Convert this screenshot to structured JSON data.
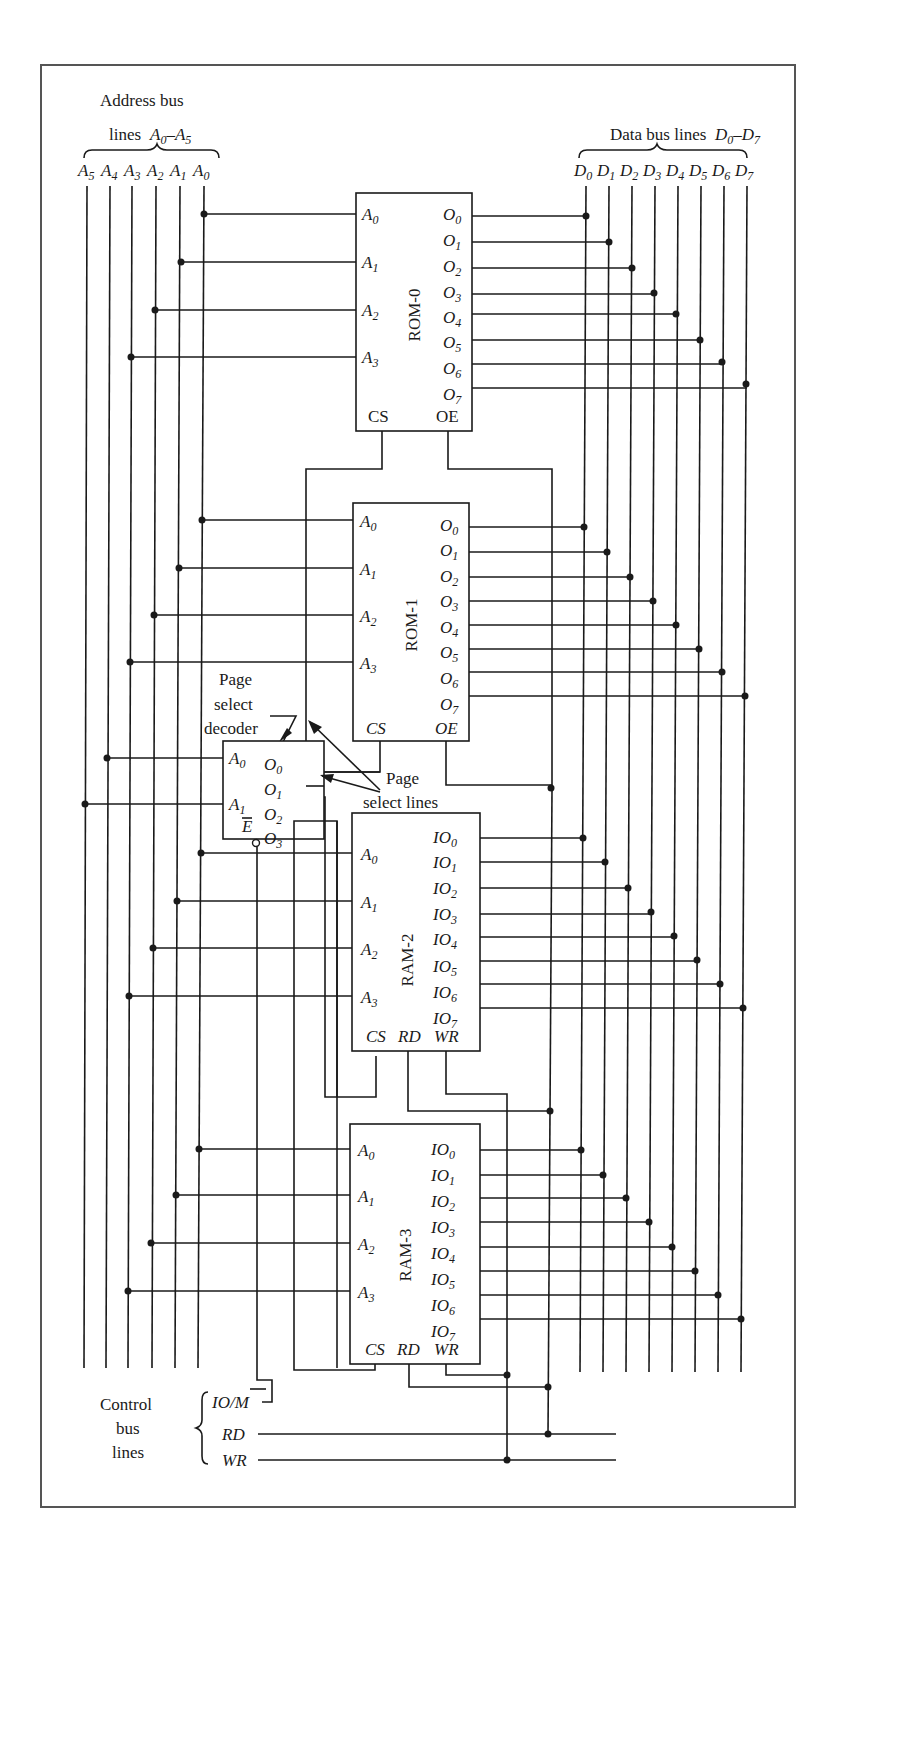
{
  "diagram": {
    "address_bus": {
      "title_line1": "Address bus",
      "title_line2_prefix": "lines",
      "range": "A0–A5",
      "lines": [
        "A5",
        "A4",
        "A3",
        "A2",
        "A1",
        "A0"
      ]
    },
    "data_bus": {
      "title_prefix": "Data bus lines",
      "range": "D0–D7",
      "lines": [
        "D0",
        "D1",
        "D2",
        "D3",
        "D4",
        "D5",
        "D6",
        "D7"
      ]
    },
    "chips": [
      {
        "name": "ROM-0",
        "inputs": [
          "A0",
          "A1",
          "A2",
          "A3"
        ],
        "outputs": [
          "O0",
          "O1",
          "O2",
          "O3",
          "O4",
          "O5",
          "O6",
          "O7"
        ],
        "controls": [
          "CS",
          "OE"
        ]
      },
      {
        "name": "ROM-1",
        "inputs": [
          "A0",
          "A1",
          "A2",
          "A3"
        ],
        "outputs": [
          "O0",
          "O1",
          "O2",
          "O3",
          "O4",
          "O5",
          "O6",
          "O7"
        ],
        "controls": [
          "CS",
          "OE"
        ]
      },
      {
        "name": "RAM-2",
        "inputs": [
          "A0",
          "A1",
          "A2",
          "A3"
        ],
        "outputs": [
          "IO0",
          "IO1",
          "IO2",
          "IO3",
          "IO4",
          "IO5",
          "IO6",
          "IO7"
        ],
        "controls": [
          "CS",
          "RD",
          "WR"
        ]
      },
      {
        "name": "RAM-3",
        "inputs": [
          "A0",
          "A1",
          "A2",
          "A3"
        ],
        "outputs": [
          "IO0",
          "IO1",
          "IO2",
          "IO3",
          "IO4",
          "IO5",
          "IO6",
          "IO7"
        ],
        "controls": [
          "CS",
          "RD",
          "WR"
        ]
      }
    ],
    "decoder": {
      "label_line1": "Page",
      "label_line2": "select",
      "label_line3": "decoder",
      "inputs": [
        "A0",
        "A1"
      ],
      "outputs": [
        "O0",
        "O1",
        "O2",
        "O3"
      ],
      "enable": "E"
    },
    "page_select_lines": {
      "line1": "Page",
      "line2": "select lines"
    },
    "control_bus": {
      "label_line1": "Control",
      "label_line2": "bus",
      "label_line3": "lines",
      "lines": [
        "IO/M",
        "RD",
        "WR"
      ]
    }
  }
}
